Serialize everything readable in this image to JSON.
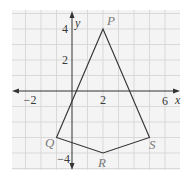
{
  "diagram": {
    "type": "coordinate-plane",
    "axes": {
      "x_label": "x",
      "y_label": "y",
      "x_ticks": [
        {
          "value": -2,
          "label": "−2"
        },
        {
          "value": 2,
          "label": "2"
        },
        {
          "value": 6,
          "label": "6"
        }
      ],
      "y_ticks": [
        {
          "value": 4,
          "label": "4"
        },
        {
          "value": 2,
          "label": "2"
        },
        {
          "value": -4,
          "label": "−4"
        }
      ],
      "x_range": [
        -4,
        7
      ],
      "y_range": [
        -5,
        5
      ],
      "grid": true
    },
    "points": {
      "P": {
        "label": "P",
        "x": 2,
        "y": 4
      },
      "Q": {
        "label": "Q",
        "x": -1,
        "y": -3
      },
      "R": {
        "label": "R",
        "x": 2,
        "y": -4
      },
      "S": {
        "label": "S",
        "x": 5,
        "y": -3
      }
    },
    "polygon": [
      "P",
      "S",
      "R",
      "Q"
    ],
    "colors": {
      "grid": "#d9d9d9",
      "axes": "#333333",
      "polygon": "#333333",
      "point_labels": "#7a7a7a",
      "background": "#f4f4f4"
    }
  }
}
